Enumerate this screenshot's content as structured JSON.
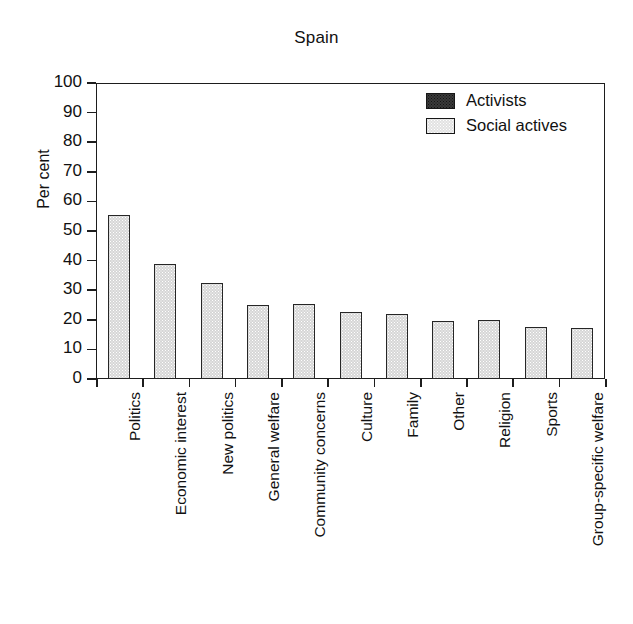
{
  "chart_data": {
    "type": "bar",
    "title": "Spain",
    "xlabel": "",
    "ylabel": "Per cent",
    "ylim": [
      0,
      100
    ],
    "yticks": [
      0,
      10,
      20,
      30,
      40,
      50,
      60,
      70,
      80,
      90,
      100
    ],
    "ytick_labels": [
      "0",
      "10",
      "20",
      "30",
      "40",
      "50",
      "60",
      "70",
      "80",
      "90",
      "100"
    ],
    "grid": false,
    "legend_position": "top-right",
    "categories": [
      "Politics",
      "Economic interest",
      "New politics",
      "General welfare",
      "Community concerns",
      "Culture",
      "Family",
      "Other",
      "Religion",
      "Sports",
      "Group-specific welfare"
    ],
    "series": [
      {
        "name": "Activists",
        "color": "#3a3a3a",
        "values": [
          0,
          0,
          0,
          0,
          0,
          0,
          0,
          0,
          0,
          0,
          0
        ]
      },
      {
        "name": "Social actives",
        "color": "#d6d6d6",
        "values": [
          55.3,
          39.0,
          32.3,
          25.1,
          25.5,
          22.7,
          22.0,
          19.7,
          19.9,
          17.6,
          17.2
        ]
      }
    ]
  },
  "legend": {
    "entries": [
      {
        "label": "Activists",
        "swatch": "dark-swatch"
      },
      {
        "label": "Social actives",
        "swatch": "light-swatch"
      }
    ]
  }
}
